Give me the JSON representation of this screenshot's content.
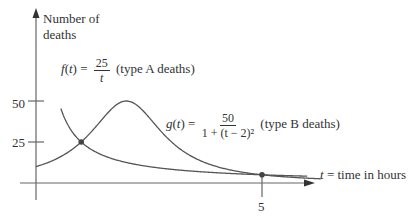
{
  "chart_data": {
    "type": "line",
    "title": "",
    "xlabel": "t = time in hours",
    "ylabel": "Number of deaths",
    "xlim": [
      0,
      6.3
    ],
    "ylim": [
      0,
      62
    ],
    "x_ticks": [
      5
    ],
    "y_ticks": [
      25,
      50
    ],
    "grid": false,
    "legend": "inline annotations",
    "series": [
      {
        "name": "f(t) = 25/t (type A deaths)",
        "formula": "25/t",
        "domain": [
          0.55,
          6.0
        ]
      },
      {
        "name": "g(t) = 50/(1+(t-2)^2) (type B deaths)",
        "formula": "50/(1+(t-2)^2)",
        "domain": [
          0,
          6.3
        ]
      }
    ],
    "intersections": [
      {
        "t": 1,
        "value": 25
      },
      {
        "t": 5,
        "value": 5
      }
    ],
    "annotations": {
      "f_label": {
        "lhs": "f(t) =",
        "num": "25",
        "den": "t",
        "suffix": "(type A deaths)"
      },
      "g_label": {
        "lhs": "g(t) =",
        "num": "50",
        "den": "1 + (t − 2)²",
        "suffix": "(type B deaths)"
      }
    }
  },
  "axis": {
    "ylabel_line1": "Number of",
    "ylabel_line2": "deaths",
    "xlabel_var": "t",
    "xlabel_rest": "= time in hours",
    "tick_50": "50",
    "tick_25": "25",
    "tick_5": "5"
  },
  "colors": {
    "curve": "#555555",
    "axis": "#666666",
    "text": "#333333"
  }
}
